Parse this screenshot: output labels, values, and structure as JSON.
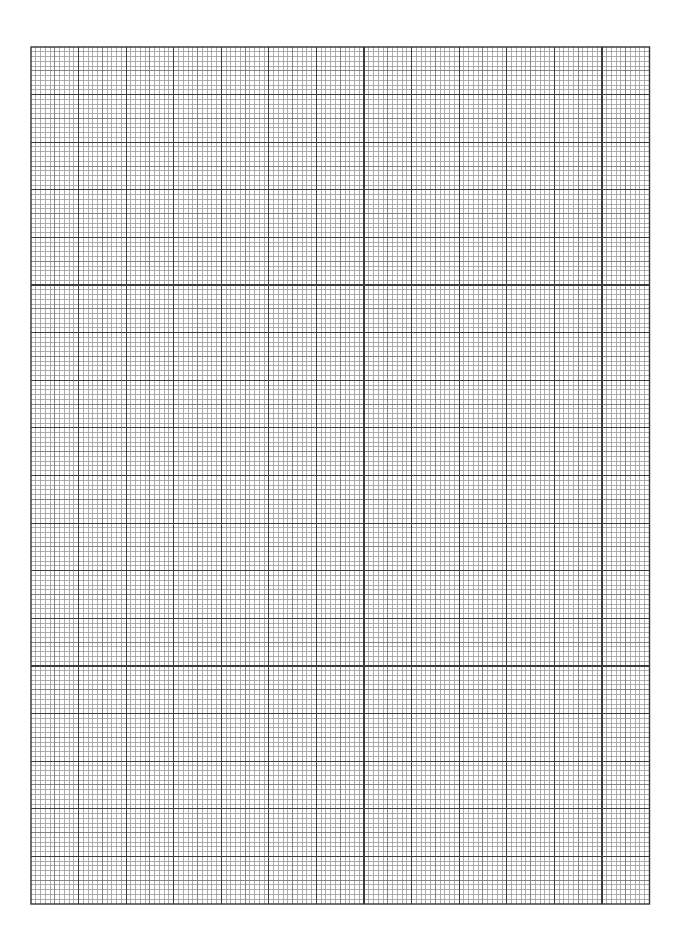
{
  "page": {
    "type": "graph-paper",
    "width": 677,
    "height": 941,
    "background": "#ffffff"
  },
  "grid": {
    "left": 30.5,
    "top": 46.5,
    "width": 618.5,
    "height": 857,
    "major_columns": 13,
    "major_rows": 18,
    "subdivisions": 10,
    "minor_line_color": "#9a9a9a",
    "mid_line_color": "#777777",
    "major_line_color": "#3c3c3c",
    "border_color": "#333333",
    "minor_line_width": 0.8,
    "mid_line_width": 0.9,
    "major_line_width": 1.2,
    "border_width": 1.4
  }
}
